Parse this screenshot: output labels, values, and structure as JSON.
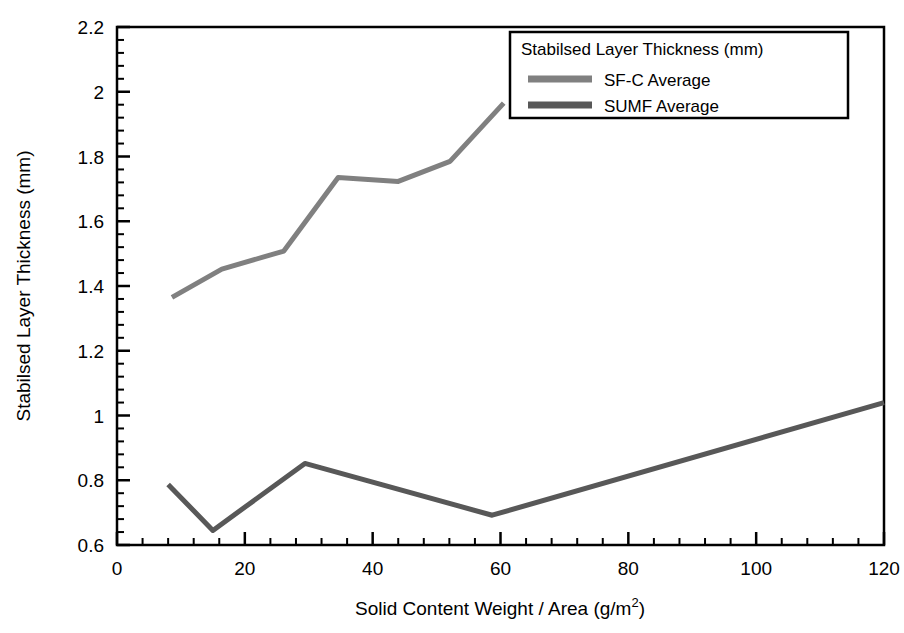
{
  "chart_data": {
    "type": "line",
    "title": "",
    "xlabel": "Solid Content Weight / Area (g/m2)",
    "xlabel_main": "Solid Content Weight / Area (g/m",
    "xlabel_sup": "2",
    "xlabel_tail": ")",
    "ylabel": "Stabilsed Layer Thickness (mm)",
    "xlim": [
      0,
      120
    ],
    "ylim": [
      0.6,
      2.2
    ],
    "xticks": [
      0,
      20,
      40,
      60,
      80,
      100,
      120
    ],
    "yticks": [
      0.6,
      0.8,
      1,
      1.2,
      1.4,
      1.6,
      1.8,
      2,
      2.2
    ],
    "xtick_labels": [
      "0",
      "20",
      "40",
      "60",
      "80",
      "100",
      "120"
    ],
    "ytick_labels": [
      "0.6",
      "0.8",
      "1",
      "1.2",
      "1.4",
      "1.6",
      "1.8",
      "2",
      "2.2"
    ],
    "x_minor_ticks_per_major": 4,
    "y_minor_ticks_per_major": 4,
    "grid": false,
    "legend_position": "top-right",
    "legend_title": "Stabilsed Layer Thickness (mm)",
    "series": [
      {
        "name": "SF-C Average",
        "color": "#808080",
        "linewidth": 5,
        "x": [
          8.6,
          16.4,
          26.1,
          34.6,
          44.0,
          52.1,
          60.5
        ],
        "y": [
          1.365,
          1.452,
          1.508,
          1.735,
          1.723,
          1.785,
          1.965
        ]
      },
      {
        "name": "SUMF Average",
        "color": "#585858",
        "linewidth": 5,
        "x": [
          8.0,
          15.0,
          29.4,
          58.7,
          120.0
        ],
        "y": [
          0.787,
          0.645,
          0.852,
          0.692,
          1.04
        ]
      }
    ]
  },
  "legend": {
    "title": "Stabilsed Layer Thickness (mm)",
    "entries": [
      {
        "label": "SF-C Average",
        "color": "#808080"
      },
      {
        "label": "SUMF Average",
        "color": "#585858"
      }
    ]
  },
  "axes": {
    "x_title": "Solid Content Weight / Area (g/m",
    "x_title_sup": "2",
    "x_title_tail": ")",
    "y_title": "Stabilsed Layer Thickness (mm)"
  },
  "colors": {
    "axis": "#000000",
    "background": "#ffffff",
    "series_sfc": "#808080",
    "series_sumf": "#585858"
  }
}
